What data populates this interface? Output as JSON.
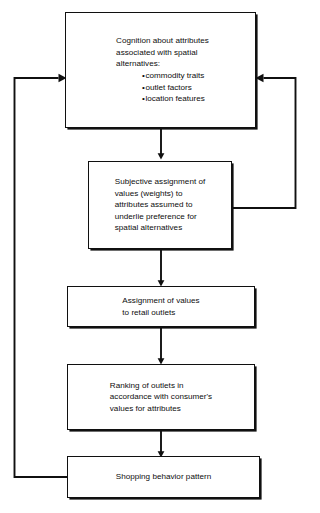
{
  "diagram": {
    "line_color": "#101010",
    "background_color": "#ffffff",
    "nodes": [
      {
        "id": "cognition",
        "lines": [
          "Cognition about attributes",
          "associated with spatial",
          "alternatives:"
        ],
        "bullets": [
          "commodity traits",
          "outlet factors",
          "location features"
        ]
      },
      {
        "id": "subjective-assignment",
        "lines": [
          "Subjective assignment of",
          "values (weights) to",
          "attributes assumed to",
          "underlie preference for",
          "spatial alternatives"
        ],
        "bullets": []
      },
      {
        "id": "assignment-values",
        "lines": [
          "Assignment of values",
          "to retail outlets"
        ],
        "bullets": []
      },
      {
        "id": "ranking-outlets",
        "lines": [
          "Ranking of outlets in",
          "accordance with consumer's",
          "values for attributes"
        ],
        "bullets": []
      },
      {
        "id": "shopping-behavior",
        "lines": [
          "Shopping behavior pattern"
        ],
        "bullets": []
      }
    ],
    "connectors": [
      {
        "id": "cognition-to-subjective",
        "kind": "arrow-down"
      },
      {
        "id": "subjective-to-assignment",
        "kind": "arrow-down"
      },
      {
        "id": "assignment-to-ranking",
        "kind": "arrow-down"
      },
      {
        "id": "ranking-to-shopping",
        "kind": "arrow-down"
      },
      {
        "id": "shopping-feedback-left",
        "kind": "feedback-loop-left"
      },
      {
        "id": "subjective-feedback-right",
        "kind": "feedback-loop-right"
      }
    ]
  }
}
